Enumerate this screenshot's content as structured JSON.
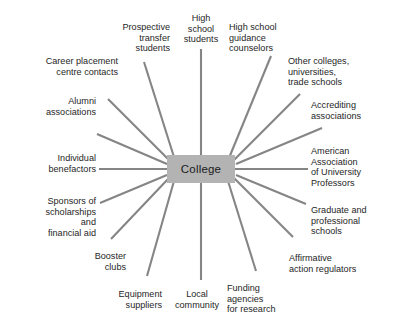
{
  "diagram": {
    "type": "radial-hub-and-spoke",
    "hub": {
      "label": "College",
      "fill": "#b3b3b3",
      "text_color": "#1a1a1a",
      "center_x": 201,
      "center_y": 169,
      "box_x": 167,
      "box_y": 155,
      "box_w": 68,
      "box_h": 28
    },
    "style": {
      "background": "#ffffff",
      "spoke_color": "#858585",
      "spoke_width": 2.1,
      "label_color": "#262626",
      "spoke_count": 16
    },
    "nodes": [
      {
        "id": "high-school-students",
        "label": "High\nschool\nstudents",
        "align": "center",
        "angle_deg": -90,
        "label_x": 171,
        "label_y": 13,
        "label_w": 60,
        "spoke_start_x": 201,
        "spoke_start_y": 155,
        "spoke_end_x": 201,
        "spoke_end_y": 49
      },
      {
        "id": "high-school-guidance-counselors",
        "label": "High school\nguidance\ncounselors",
        "align": "left",
        "angle_deg": -67.5,
        "label_x": 229,
        "label_y": 22,
        "label_w": 64,
        "spoke_start_x": 229,
        "spoke_start_y": 158,
        "spoke_end_x": 271,
        "spoke_end_y": 56
      },
      {
        "id": "other-colleges-universities-trade-schools",
        "label": "Other colleges,\nuniversities,\ntrade schools",
        "align": "left",
        "angle_deg": -45,
        "label_x": 288,
        "label_y": 56,
        "label_w": 78,
        "spoke_start_x": 234,
        "spoke_start_y": 160,
        "spoke_end_x": 300,
        "spoke_end_y": 94
      },
      {
        "id": "accrediting-associations",
        "label": "Accrediting\nassociations",
        "align": "left",
        "angle_deg": -22.5,
        "label_x": 311,
        "label_y": 100,
        "label_w": 72,
        "spoke_start_x": 236,
        "spoke_start_y": 164,
        "spoke_end_x": 322,
        "spoke_end_y": 128
      },
      {
        "id": "american-association-of-university-professors",
        "label": "American\nAssociation\nof University\nProfessors",
        "align": "left",
        "angle_deg": 0,
        "label_x": 311,
        "label_y": 146,
        "label_w": 80,
        "spoke_start_x": 235,
        "spoke_start_y": 169,
        "spoke_end_x": 308,
        "spoke_end_y": 169
      },
      {
        "id": "graduate-and-professional-schools",
        "label": "Graduate and\nprofessional\nschools",
        "align": "left",
        "angle_deg": 22.5,
        "label_x": 311,
        "label_y": 205,
        "label_w": 80,
        "spoke_start_x": 236,
        "spoke_start_y": 175,
        "spoke_end_x": 306,
        "spoke_end_y": 204
      },
      {
        "id": "affirmative-action-regulators",
        "label": "Affirmative\naction regulators",
        "align": "left",
        "angle_deg": 45,
        "label_x": 289,
        "label_y": 253,
        "label_w": 92,
        "spoke_start_x": 234,
        "spoke_start_y": 178,
        "spoke_end_x": 293,
        "spoke_end_y": 237
      },
      {
        "id": "funding-agencies-for-research",
        "label": "Funding\nagencies\nfor research",
        "align": "left",
        "angle_deg": 67.5,
        "label_x": 227,
        "label_y": 283,
        "label_w": 68,
        "spoke_start_x": 228,
        "spoke_start_y": 181,
        "spoke_end_x": 256,
        "spoke_end_y": 271
      },
      {
        "id": "local-community",
        "label": "Local\ncommunity",
        "align": "center",
        "angle_deg": 90,
        "label_x": 166,
        "label_y": 289,
        "label_w": 62,
        "spoke_start_x": 201,
        "spoke_start_y": 183,
        "spoke_end_x": 201,
        "spoke_end_y": 280
      },
      {
        "id": "equipment-suppliers",
        "label": "Equipment\nsuppliers",
        "align": "right",
        "angle_deg": 112.5,
        "label_x": 100,
        "label_y": 289,
        "label_w": 62,
        "spoke_start_x": 174,
        "spoke_start_y": 181,
        "spoke_end_x": 147,
        "spoke_end_y": 276
      },
      {
        "id": "booster-clubs",
        "label": "Booster\nclubs",
        "align": "right",
        "angle_deg": 135,
        "label_x": 68,
        "label_y": 251,
        "label_w": 58,
        "spoke_start_x": 169,
        "spoke_start_y": 178,
        "spoke_end_x": 111,
        "spoke_end_y": 239
      },
      {
        "id": "sponsors-of-scholarships-and-financial-aid",
        "label": "Sponsors of\nscholarships\nand\nfinancial aid",
        "align": "right",
        "angle_deg": 157.5,
        "label_x": 20,
        "label_y": 196,
        "label_w": 76,
        "spoke_start_x": 167,
        "spoke_start_y": 175,
        "spoke_end_x": 100,
        "spoke_end_y": 203
      },
      {
        "id": "individual-benefactors",
        "label": "Individual\nbenefactors",
        "align": "right",
        "angle_deg": 180,
        "label_x": 22,
        "label_y": 153,
        "label_w": 74,
        "spoke_start_x": 167,
        "spoke_start_y": 169,
        "spoke_end_x": 99,
        "spoke_end_y": 169
      },
      {
        "id": "alumni-associations",
        "label": "Alumni\nassociations",
        "align": "right",
        "angle_deg": -157.5,
        "label_x": 22,
        "label_y": 96,
        "label_w": 74,
        "spoke_start_x": 167,
        "spoke_start_y": 164,
        "spoke_end_x": 97,
        "spoke_end_y": 134
      },
      {
        "id": "career-placement-centre-contacts",
        "label": "Career placement\ncentre contacts",
        "align": "right",
        "angle_deg": -135,
        "label_x": 22,
        "label_y": 56,
        "label_w": 96,
        "spoke_start_x": 169,
        "spoke_start_y": 160,
        "spoke_end_x": 108,
        "spoke_end_y": 99
      },
      {
        "id": "prospective-transfer-students",
        "label": "Prospective\ntransfer\nstudents",
        "align": "right",
        "angle_deg": -112.5,
        "label_x": 102,
        "label_y": 22,
        "label_w": 68,
        "spoke_start_x": 174,
        "spoke_start_y": 157,
        "spoke_end_x": 144,
        "spoke_end_y": 62
      }
    ]
  }
}
